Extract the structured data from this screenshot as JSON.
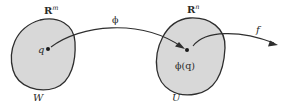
{
  "diagram": {
    "type": "mapping-diagram",
    "colors": {
      "region_fill": "#d8d8d8",
      "stroke": "#2e2e2e",
      "text": "#2a2a2a",
      "background": "#ffffff"
    },
    "left_region": {
      "space_label_base": "R",
      "space_label_sup": "m",
      "region_label": "W",
      "point_label": "q"
    },
    "right_region": {
      "space_label_base": "R",
      "space_label_sup": "n",
      "region_label": "U",
      "point_label": "ϕ(q)"
    },
    "arrows": [
      {
        "label": "ϕ",
        "from": "q",
        "to": "ϕ(q)"
      },
      {
        "label": "f",
        "from": "ϕ(q)",
        "to": "outside"
      }
    ]
  }
}
